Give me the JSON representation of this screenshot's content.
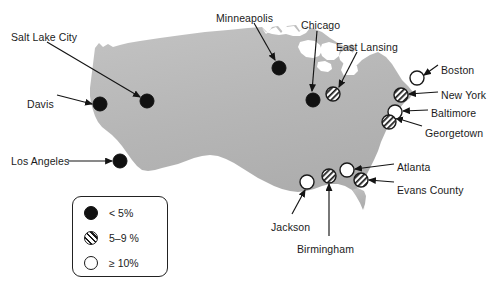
{
  "figure": {
    "name": "united-states-study-sites-map",
    "background_color": "#ffffff",
    "land_color": "#b9b9b9",
    "marker_outline_color": "#1a1a1a"
  },
  "legend": {
    "name": "prevalence-legend",
    "items": [
      {
        "symbol": "solid-circle",
        "label": "< 5%"
      },
      {
        "symbol": "hatched-circle",
        "label": "5–9 %"
      },
      {
        "symbol": "open-circle",
        "label": "≥ 10%"
      }
    ]
  },
  "cities": [
    {
      "name": "Salt Lake City",
      "symbol": "solid-circle",
      "label_x": 11,
      "label_y": 31,
      "marker_x": 147,
      "marker_y": 101
    },
    {
      "name": "Davis",
      "symbol": "solid-circle",
      "label_x": 27,
      "label_y": 98,
      "marker_x": 100,
      "marker_y": 104
    },
    {
      "name": "Los Angeles",
      "symbol": "solid-circle",
      "label_x": 11,
      "label_y": 155,
      "marker_x": 120,
      "marker_y": 161
    },
    {
      "name": "Minneapolis",
      "symbol": "solid-circle",
      "label_x": 216,
      "label_y": 12,
      "marker_x": 279,
      "marker_y": 68
    },
    {
      "name": "Chicago",
      "symbol": "solid-circle",
      "label_x": 301,
      "label_y": 19,
      "marker_x": 313,
      "marker_y": 100
    },
    {
      "name": "East Lansing",
      "symbol": "hatched-circle",
      "label_x": 336,
      "label_y": 41,
      "marker_x": 333,
      "marker_y": 94
    },
    {
      "name": "Boston",
      "symbol": "open-circle",
      "label_x": 441,
      "label_y": 64,
      "marker_x": 417,
      "marker_y": 78
    },
    {
      "name": "New York",
      "symbol": "hatched-circle",
      "label_x": 441,
      "label_y": 89,
      "marker_x": 401,
      "marker_y": 95
    },
    {
      "name": "Baltimore",
      "symbol": "open-circle",
      "label_x": 431,
      "label_y": 107,
      "marker_x": 395,
      "marker_y": 112
    },
    {
      "name": "Georgetown",
      "symbol": "hatched-circle",
      "label_x": 425,
      "label_y": 127,
      "marker_x": 389,
      "marker_y": 122
    },
    {
      "name": "Atlanta",
      "symbol": "open-circle",
      "label_x": 397,
      "label_y": 161,
      "marker_x": 347,
      "marker_y": 170
    },
    {
      "name": "Evans County",
      "symbol": "hatched-circle",
      "label_x": 397,
      "label_y": 184,
      "marker_x": 361,
      "marker_y": 180
    },
    {
      "name": "Jackson",
      "symbol": "open-circle",
      "label_x": 271,
      "label_y": 221,
      "marker_x": 307,
      "marker_y": 182
    },
    {
      "name": "Birmingham",
      "symbol": "hatched-circle",
      "label_x": 297,
      "label_y": 243,
      "marker_x": 329,
      "marker_y": 176
    }
  ],
  "leader_lines": [
    {
      "for": "Salt Lake City",
      "x1": 47,
      "y1": 42,
      "x2": 140,
      "y2": 97,
      "arrow": true
    },
    {
      "for": "Davis",
      "x1": 57,
      "y1": 95,
      "x2": 92,
      "y2": 104,
      "arrow": true
    },
    {
      "for": "Los Angeles",
      "x1": 68,
      "y1": 161,
      "x2": 112,
      "y2": 161,
      "arrow": true
    },
    {
      "for": "Minneapolis",
      "x1": 254,
      "y1": 23,
      "x2": 275,
      "y2": 60,
      "arrow": true
    },
    {
      "for": "Chicago",
      "x1": 317,
      "y1": 31,
      "x2": 312,
      "y2": 91,
      "arrow": true
    },
    {
      "for": "East Lansing",
      "x1": 357,
      "y1": 52,
      "x2": 339,
      "y2": 87,
      "arrow": true
    },
    {
      "for": "Boston",
      "x1": 438,
      "y1": 65,
      "x2": 424,
      "y2": 75,
      "arrow": true
    },
    {
      "for": "New York",
      "x1": 438,
      "y1": 92,
      "x2": 409,
      "y2": 94,
      "arrow": true
    },
    {
      "for": "Baltimore",
      "x1": 428,
      "y1": 110,
      "x2": 403,
      "y2": 111,
      "arrow": true
    },
    {
      "for": "Georgetown",
      "x1": 422,
      "y1": 126,
      "x2": 396,
      "y2": 118,
      "arrow": true
    },
    {
      "for": "Atlanta",
      "x1": 394,
      "y1": 164,
      "x2": 355,
      "y2": 169,
      "arrow": true
    },
    {
      "for": "Evans County",
      "x1": 394,
      "y1": 182,
      "x2": 369,
      "y2": 180,
      "arrow": true
    },
    {
      "for": "Jackson",
      "x1": 292,
      "y1": 214,
      "x2": 305,
      "y2": 190,
      "arrow": true
    },
    {
      "for": "Birmingham",
      "x1": 329,
      "y1": 236,
      "x2": 329,
      "y2": 184,
      "arrow": true
    }
  ]
}
